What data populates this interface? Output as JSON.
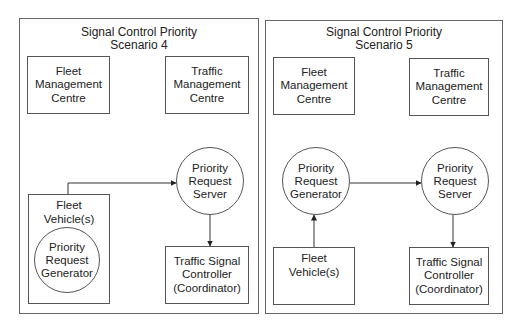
{
  "scenario4": {
    "title": "Signal Control Priority\nScenario 4",
    "fleet_mgmt": "Fleet\nManagement\nCentre",
    "traffic_mgmt": "Traffic\nManagement\nCentre",
    "fleet_vehicle": "Fleet\nVehicle(s)",
    "prg": "Priority\nRequest\nGenerator",
    "prs": "Priority\nRequest\nServer",
    "tsc": "Traffic Signal\nController\n(Coordinator)"
  },
  "scenario5": {
    "title": "Signal Control Priority\nScenario 5",
    "fleet_mgmt": "Fleet\nManagement\nCentre",
    "traffic_mgmt": "Traffic\nManagement\nCentre",
    "prg": "Priority\nRequest\nGenerator",
    "prs": "Priority\nRequest\nServer",
    "fleet_vehicle": "Fleet\nVehicle(s)",
    "tsc": "Traffic Signal\nController\n(Coordinator)"
  }
}
